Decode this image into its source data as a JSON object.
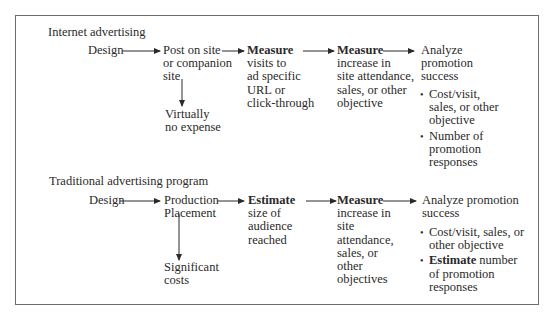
{
  "figure": {
    "sections": [
      {
        "title": "Internet advertising",
        "steps": [
          {
            "lines": [
              "Design"
            ]
          },
          {
            "lines": [
              "Post on site",
              "or companion",
              "site"
            ]
          },
          {
            "bold": "Measure",
            "lines": [
              "visits to",
              "ad specific",
              "URL or",
              "click-through"
            ]
          },
          {
            "bold": "Measure",
            "lines": [
              "increase in",
              "site attendance,",
              "sales, or other",
              "objective"
            ]
          },
          {
            "lines": [
              "Analyze",
              "promotion",
              "success"
            ],
            "bullets": [
              {
                "lines": [
                  "Cost/visit,",
                  "sales, or other",
                  "objective"
                ]
              },
              {
                "lines": [
                  "Number of",
                  "promotion",
                  "responses"
                ]
              }
            ]
          }
        ],
        "branch": {
          "lines": [
            "Virtually",
            "no expense"
          ]
        }
      },
      {
        "title": "Traditional advertising program",
        "steps": [
          {
            "lines": [
              "Design"
            ]
          },
          {
            "lines": [
              "Production",
              "Placement"
            ]
          },
          {
            "bold": "Estimate",
            "lines": [
              "size of",
              "audience",
              "reached"
            ]
          },
          {
            "bold": "Measure",
            "lines": [
              "increase in",
              "site",
              "attendance,",
              "sales, or",
              "other",
              "objectives"
            ]
          },
          {
            "lines": [
              "Analyze promotion",
              "success"
            ],
            "bullets": [
              {
                "lines": [
                  "Cost/visit, sales, or",
                  "other objective"
                ]
              },
              {
                "bold": "Estimate",
                "lines": [
                  " number",
                  "of promotion",
                  "responses"
                ]
              }
            ]
          }
        ],
        "branch": {
          "lines": [
            "Significant",
            "costs"
          ]
        }
      }
    ]
  }
}
